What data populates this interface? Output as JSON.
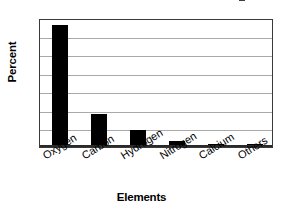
{
  "chart_data": {
    "type": "bar",
    "title": "",
    "xlabel": "Elements",
    "ylabel": "Percent",
    "categories": [
      "Oxygen",
      "Carbon",
      "Hydrogen",
      "Nitrogen",
      "Calcium",
      "Others"
    ],
    "values": [
      66,
      18,
      9.5,
      3,
      1.5,
      1.5
    ],
    "ylim": [
      0,
      70
    ],
    "yticks": [
      0,
      10,
      20,
      30,
      40,
      50,
      60,
      70
    ],
    "ytick_labels": [
      "0",
      "10",
      "20",
      "30",
      "40",
      "50",
      "60",
      "70"
    ],
    "grid": true,
    "grid_axis": "y",
    "legend": false,
    "bar_color": "#000000",
    "plot_background": "#ffffff",
    "frame_color": "#3a3a3a",
    "gridline_color": "#a9a9a9"
  },
  "figure": {
    "background": "#ffffff",
    "title_cropped": true
  }
}
